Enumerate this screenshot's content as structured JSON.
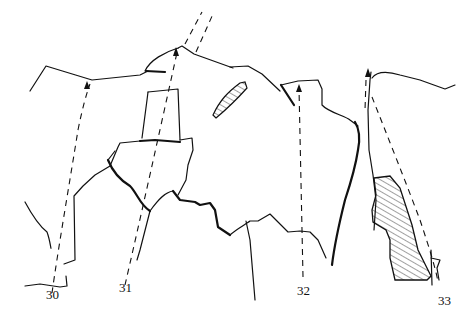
{
  "diagram": {
    "type": "route topo line drawing",
    "routes": [
      {
        "number": "30",
        "label_x": 46,
        "label_y": 287
      },
      {
        "number": "31",
        "label_x": 119,
        "label_y": 280
      },
      {
        "number": "32",
        "label_x": 297,
        "label_y": 283
      },
      {
        "number": "33",
        "label_x": 438,
        "label_y": 293
      }
    ],
    "colors": {
      "line": "#111111",
      "background": "#ffffff"
    }
  }
}
